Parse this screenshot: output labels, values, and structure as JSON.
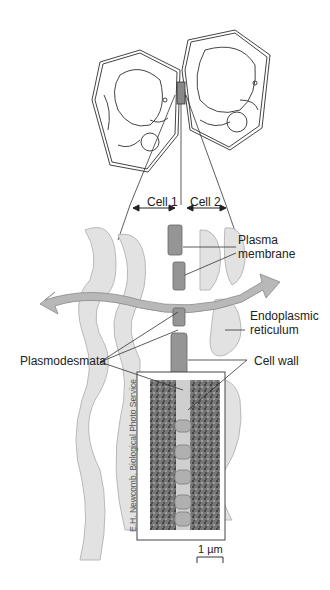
{
  "diagram": {
    "top_labels": {
      "cell1": "Cell 1",
      "cell2": "Cell 2"
    },
    "labels": {
      "plasma_membrane_line1": "Plasma",
      "plasma_membrane_line2": "membrane",
      "er_line1": "Endoplasmic",
      "er_line2": "reticulum",
      "plasmodesmata": "Plasmodesmata",
      "cell_wall": "Cell wall"
    },
    "micrograph_credit": "E.H. Newcomb, Biological Photo Service",
    "scale_bar": "1 µm",
    "colors": {
      "line": "#333333",
      "membrane_fill": "#d6d6d6",
      "membrane_stroke": "#a8a8a8",
      "wall_fill": "#8e8e8e",
      "arrow_fill": "#b5b5b5"
    }
  }
}
